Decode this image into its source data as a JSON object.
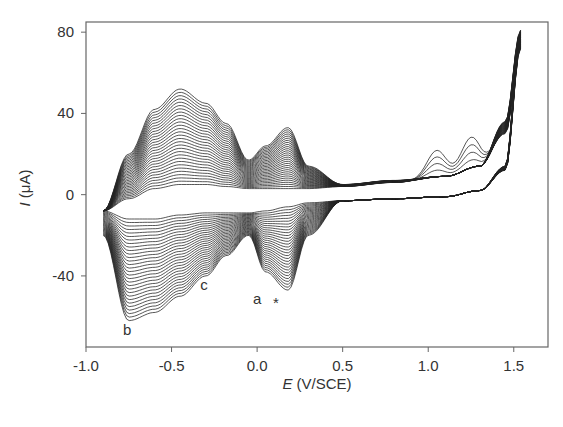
{
  "chart_data": {
    "type": "line",
    "title": "",
    "xlabel": "E (V/SCE)",
    "xlabel_italic": "E",
    "xlabel_rest": " (V/SCE)",
    "ylabel": "I (μA)",
    "ylabel_italic": "I",
    "ylabel_rest": " (μA)",
    "xlim": [
      -1.0,
      1.7
    ],
    "ylim": [
      -75,
      85
    ],
    "xticks": [
      -1.0,
      -0.5,
      0.0,
      0.5,
      1.0,
      1.5
    ],
    "xtick_labels": [
      "-1.0",
      "-0.5",
      "0.0",
      "0.5",
      "1.0",
      "1.5"
    ],
    "yticks": [
      80,
      40,
      0,
      -40
    ],
    "ytick_labels": [
      "80",
      "40",
      "0",
      "-40"
    ],
    "grid": false,
    "legend": null,
    "n_cycles": 30,
    "potential_window": [
      -0.9,
      1.54
    ],
    "anodic_peaks_final_cycle": [
      {
        "E": -0.45,
        "I": 52
      },
      {
        "E": -0.18,
        "I": 35,
        "note": "shoulder"
      },
      {
        "E": 0.18,
        "I": 33
      }
    ],
    "cathodic_peaks_final_cycle": [
      {
        "label": "b",
        "E": -0.76,
        "I": -62
      },
      {
        "label": "c",
        "E": -0.35,
        "I": -38,
        "note": "shoulder"
      },
      {
        "label": "a",
        "E": 0.1,
        "I": -47
      }
    ],
    "vertex_current_max": {
      "E": 1.54,
      "I": 81
    },
    "first_cycle_oxidation_bumps": [
      {
        "E": 1.05,
        "I": 22
      },
      {
        "E": 1.25,
        "I": 24
      }
    ],
    "series_envelope": {
      "E": [
        -0.9,
        -0.75,
        -0.6,
        -0.45,
        -0.3,
        -0.18,
        -0.05,
        0.05,
        0.18,
        0.3,
        0.5,
        0.8,
        1.1,
        1.3,
        1.45,
        1.54
      ],
      "I_anodic_first": [
        -8,
        -2,
        3,
        5,
        5,
        4,
        3,
        3,
        3,
        3,
        4,
        6,
        9,
        14,
        30,
        72
      ],
      "I_anodic_last": [
        -8,
        20,
        42,
        52,
        45,
        35,
        17,
        24,
        33,
        14,
        5,
        7,
        9,
        14,
        36,
        81
      ],
      "I_cathodic_first": [
        -8,
        -12,
        -12,
        -10,
        -9,
        -9,
        -9,
        -8,
        -6,
        -4,
        -3,
        -2,
        -1,
        2,
        12,
        72
      ],
      "I_cathodic_last": [
        -20,
        -62,
        -58,
        -50,
        -40,
        -30,
        -20,
        -38,
        -47,
        -20,
        -3,
        -2,
        -1,
        2,
        14,
        81
      ]
    },
    "annotations": [
      {
        "text": "b",
        "E": -0.76,
        "I": -69
      },
      {
        "text": "c",
        "E": -0.31,
        "I": -47
      },
      {
        "text": "a",
        "E": 0.0,
        "I": -54
      },
      {
        "text": "*",
        "E": 0.11,
        "I": -56
      }
    ],
    "line_color": "#222222"
  }
}
